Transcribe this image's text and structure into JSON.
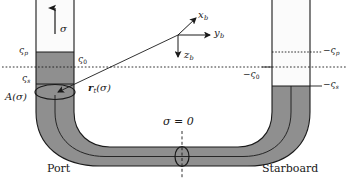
{
  "figure": {
    "width": 349,
    "height": 182,
    "background": "#ffffff",
    "tank_fill_color": "#8f8f8f",
    "tank_empty_color": "#f2f2f2",
    "line_color": "#1a1a1a"
  },
  "labels": {
    "sigma_axis": "σ",
    "zeta_p_left": "ς",
    "zeta_p_left_sub": "p",
    "zeta_0_left": "ς",
    "zeta_0_left_sub": "0",
    "zeta_s_left": "ς",
    "zeta_s_left_sub": "s",
    "area_label": "A(σ)",
    "position_vector": "r",
    "position_vector_sub": "t",
    "position_vector_arg": "(σ)",
    "axis_xb": "x",
    "axis_xb_sub": "b",
    "axis_yb": "y",
    "axis_yb_sub": "b",
    "axis_zb": "z",
    "axis_zb_sub": "b",
    "zeta_p_right": "−ς",
    "zeta_p_right_sub": "p",
    "zeta_0_right": "−ς",
    "zeta_0_right_sub": "0",
    "zeta_s_right": "−ς",
    "zeta_s_right_sub": "s",
    "sigma_zero": "σ = 0",
    "port": "Port",
    "starboard": "Starboard"
  },
  "geometry": {
    "waterline_y": 67,
    "port_tube_left_x": 36,
    "port_tube_right_x": 74,
    "starboard_tube_left_x": 272,
    "starboard_tube_right_x": 310,
    "port_fill_top_y": 52,
    "starboard_fill_top_y": 86,
    "sigma_zero_x": 182
  }
}
